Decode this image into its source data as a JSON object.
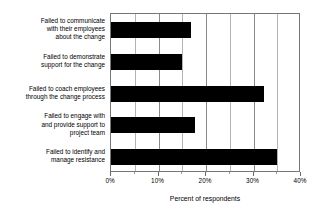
{
  "chart_data": {
    "type": "bar",
    "orientation": "horizontal",
    "title": "",
    "xlabel": "Percent of respondents",
    "ylabel": "",
    "categories": [
      "Failed to communicate\nwith their employees\nabout the change",
      "Failed to demonstrate\nsupport for the change",
      "Failed to coach employees\nthrough the change process",
      "Failed to engage with\nand provide support to\nproject team",
      "Failed to identify and\nmanage resistance"
    ],
    "values": [
      16.8,
      15.0,
      32.3,
      17.7,
      35.0
    ],
    "xlim": [
      0,
      40
    ],
    "ylim": null,
    "xticks": [
      0,
      10,
      20,
      30,
      40
    ],
    "xticklabels": [
      "0%",
      "10%",
      "20%",
      "30%",
      "40%"
    ],
    "minor_xticks": [
      5,
      15,
      25,
      35
    ],
    "grid": "vertical",
    "legend": null,
    "bar_color": "#000000",
    "frame_color": "#767676",
    "background": "#ffffff"
  }
}
